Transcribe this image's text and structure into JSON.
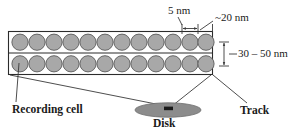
{
  "figure": {
    "colors": {
      "cell_fill": "#a8a8a8",
      "cell_stroke": "#5a5a5a",
      "box_stroke": "#2b2b2b",
      "disk_fill": "#8c8c8c",
      "disk_stroke": "#6e6e6e",
      "mark_fill": "#1a1a1a",
      "line": "#3a3a3a",
      "text": "#1a1a1a",
      "background": "#ffffff"
    }
  },
  "structure": {
    "rows": 2,
    "cells_per_row": 12
  },
  "dimensions": [
    {
      "id": "cell_gap",
      "label": "5 nm",
      "orientation": "horizontal"
    },
    {
      "id": "cell_pitch",
      "label": "~20 nm",
      "orientation": "horizontal"
    },
    {
      "id": "track_spacing",
      "label": "30 – 50 nm",
      "orientation": "vertical"
    }
  ],
  "callouts": [
    {
      "id": "recording_cell",
      "label": "Recording cell"
    },
    {
      "id": "disk",
      "label": "Disk"
    },
    {
      "id": "track",
      "label": "Track"
    }
  ]
}
